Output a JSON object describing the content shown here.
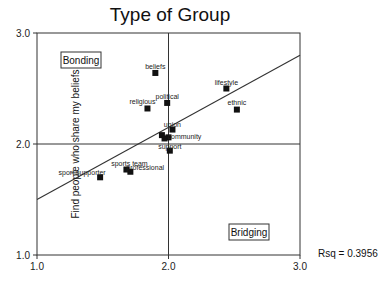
{
  "chart_data": {
    "type": "scatter",
    "title": "Type of Group",
    "xlabel": "",
    "ylabel": "Find people who share my beliefs",
    "xlim": [
      1.0,
      3.0
    ],
    "ylim": [
      1.0,
      3.0
    ],
    "x_ticks": [
      "1.0",
      "2.0",
      "3.0"
    ],
    "y_ticks": [
      "1.0",
      "2.0",
      "3.0"
    ],
    "reference_lines": {
      "x": 2.0,
      "y": 2.0
    },
    "quadrant_labels": [
      {
        "text": "Bonding",
        "position": "top-left"
      },
      {
        "text": "Bridging",
        "position": "bottom-right"
      }
    ],
    "regression_line": {
      "x": [
        1.0,
        3.0
      ],
      "y": [
        1.5,
        2.8
      ]
    },
    "annotation": "Rsq = 0.3956",
    "grid": false,
    "points": [
      {
        "label": "beliefs",
        "x": 1.9,
        "y": 2.64
      },
      {
        "label": "political",
        "x": 1.99,
        "y": 2.37
      },
      {
        "label": "religious",
        "x": 1.84,
        "y": 2.32
      },
      {
        "label": "lifestyle",
        "x": 2.44,
        "y": 2.5
      },
      {
        "label": "ethnic",
        "x": 2.52,
        "y": 2.31
      },
      {
        "label": "union",
        "x": 2.03,
        "y": 2.13
      },
      {
        "label": "community",
        "x": 2.0,
        "y": 2.06
      },
      {
        "label": "",
        "x": 1.95,
        "y": 2.08
      },
      {
        "label": "",
        "x": 1.97,
        "y": 2.05
      },
      {
        "label": "support",
        "x": 2.01,
        "y": 1.94
      },
      {
        "label": "sports team",
        "x": 1.68,
        "y": 1.77
      },
      {
        "label": "professional",
        "x": 1.71,
        "y": 1.75
      },
      {
        "label": "sport supporter",
        "x": 1.48,
        "y": 1.7
      }
    ]
  },
  "labels": {
    "title": "Type of Group",
    "ylabel": "Find people who share my beliefs",
    "rsq": "Rsq = 0.3956"
  }
}
